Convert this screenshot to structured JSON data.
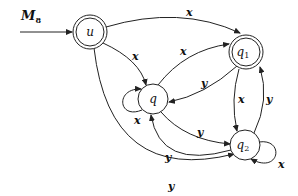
{
  "title": {
    "main": "M",
    "sub": "8"
  },
  "nodes": {
    "u": {
      "label": "u",
      "sub": "",
      "accepting": true
    },
    "q": {
      "label": "q",
      "sub": "",
      "accepting": false
    },
    "q1": {
      "label": "q",
      "sub": "1",
      "accepting": true
    },
    "q2": {
      "label": "q",
      "sub": "2",
      "accepting": false
    }
  },
  "edges": [
    {
      "from": "start",
      "to": "u",
      "label": ""
    },
    {
      "from": "u",
      "to": "q1",
      "label": "x"
    },
    {
      "from": "u",
      "to": "q",
      "label": "x"
    },
    {
      "from": "u",
      "to": "q2",
      "label": "y"
    },
    {
      "from": "q",
      "to": "q",
      "label": "x"
    },
    {
      "from": "q",
      "to": "q1",
      "label": "x"
    },
    {
      "from": "q1",
      "to": "q",
      "label": "y"
    },
    {
      "from": "q",
      "to": "q2",
      "label": "y"
    },
    {
      "from": "q2",
      "to": "q",
      "label": "y"
    },
    {
      "from": "q1",
      "to": "q2",
      "label": "x"
    },
    {
      "from": "q2",
      "to": "q1",
      "label": "y"
    },
    {
      "from": "q2",
      "to": "q2",
      "label": "x"
    }
  ]
}
